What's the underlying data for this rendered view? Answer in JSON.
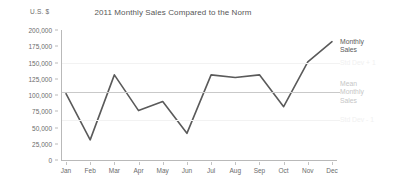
{
  "chart_data": {
    "type": "line",
    "title": "2011 Monthly Sales Compared to the Norm",
    "xlabel": "",
    "ylabel": "U.S. $",
    "ylim": [
      0,
      200000
    ],
    "ytick_labels": [
      "200,000",
      "175,000",
      "150,000",
      "125,000",
      "100,000",
      "75,000",
      "50,000",
      "25,000",
      "0"
    ],
    "ytick_values": [
      200000,
      175000,
      150000,
      125000,
      100000,
      75000,
      50000,
      25000,
      0
    ],
    "categories": [
      "Jan",
      "Feb",
      "Mar",
      "Apr",
      "May",
      "Jun",
      "Jul",
      "Aug",
      "Sep",
      "Oct",
      "Nov",
      "Dec"
    ],
    "grid": false,
    "legend_position": "right",
    "series": [
      {
        "name": "Monthly Sales",
        "color": "#5a5a5a",
        "values": [
          102000,
          31000,
          131000,
          76000,
          90000,
          41000,
          131000,
          127000,
          131000,
          82000,
          151000,
          182000
        ]
      }
    ],
    "reference_lines": [
      {
        "name": "Std Dev + 1",
        "value": 150000,
        "color": "#f2f2f2",
        "label_color": "#f0f0f0"
      },
      {
        "name": "Mean Monthly Sales",
        "value": 105000,
        "color": "#c9c9c9",
        "label_color": "#c6c6c6"
      },
      {
        "name": "Std Dev - 1",
        "value": 62000,
        "color": "#f2f2f2",
        "label_color": "#f0f0f0"
      }
    ],
    "axis_color": "#b9b9b9",
    "background": "#ffffff"
  },
  "legend": {
    "series_label_line1": "Monthly",
    "series_label_line2": "Sales"
  }
}
